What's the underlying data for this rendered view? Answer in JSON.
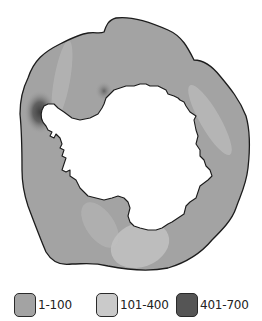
{
  "map": {
    "subject": "Antarctica with surrounding ocean region shaded by value range",
    "colors": {
      "ocean_base": "#a3a3a3",
      "ocean_light": "#c2c2c2",
      "ocean_dark": "#505050",
      "land": "#ffffff",
      "outline": "#1c1c1c"
    }
  },
  "legend": {
    "items": [
      {
        "label": "1-100",
        "color": "#a3a3a3"
      },
      {
        "label": "101-400",
        "color": "#cacaca"
      },
      {
        "label": "401-700",
        "color": "#555555"
      }
    ]
  }
}
